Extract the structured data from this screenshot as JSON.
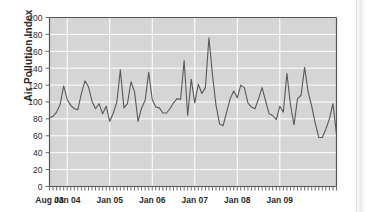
{
  "chart_data": {
    "type": "line",
    "title": "",
    "xlabel": "",
    "ylabel": "Air Pollution Index",
    "ylim": [
      0,
      200
    ],
    "ytick_step": 20,
    "yticks": [
      0,
      20,
      40,
      60,
      80,
      100,
      120,
      140,
      160,
      180,
      200
    ],
    "xtick_labels": [
      "Aug 03",
      "Jan 04",
      "Jan 05",
      "Jan 06",
      "Jan 07",
      "Jan 08",
      "Jan 09"
    ],
    "xtick_positions": [
      0,
      5,
      17,
      29,
      41,
      53,
      65
    ],
    "x_minor_ticks": "monthly",
    "grid": "horizontal-and-vertical-white-gridlines-on-grey-panel",
    "legend": "none",
    "series": [
      {
        "name": "Air Pollution Index",
        "color": "#595959",
        "x_start": "Aug 03",
        "x_end": "Jan 09",
        "x_interval": "monthly",
        "values": [
          81,
          83,
          88,
          97,
          119,
          103,
          96,
          92,
          91,
          110,
          125,
          118,
          101,
          92,
          98,
          86,
          95,
          77,
          87,
          100,
          138,
          93,
          98,
          124,
          112,
          77,
          93,
          102,
          135,
          103,
          94,
          93,
          87,
          87,
          92,
          99,
          104,
          103,
          149,
          84,
          127,
          99,
          121,
          110,
          117,
          176,
          132,
          96,
          74,
          72,
          88,
          104,
          113,
          105,
          120,
          117,
          99,
          94,
          92,
          104,
          117,
          101,
          86,
          84,
          79,
          95,
          88,
          134,
          97,
          73,
          104,
          108,
          141,
          112,
          95,
          75,
          58,
          58,
          68,
          80,
          98,
          62
        ]
      }
    ],
    "colors": {
      "line": "#595959",
      "panel": "#d5d5d5",
      "gridline": "#ffffff",
      "axis": "#6b6b6b",
      "tick_label": "#2b2b2b",
      "background": "#ffffff"
    }
  },
  "axes": {
    "y_axis_title": "Air Pollution Index"
  }
}
